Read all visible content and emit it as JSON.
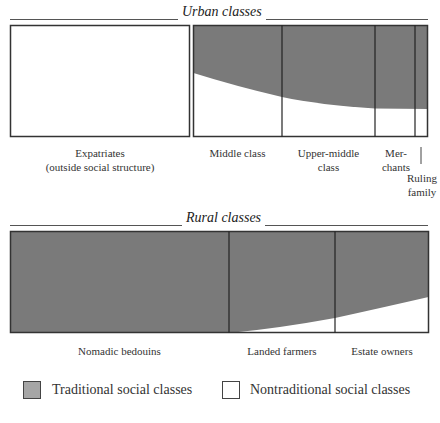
{
  "urban": {
    "title": "Urban classes",
    "labels": {
      "expatriates_line1": "Expatriates",
      "expatriates_line2": "(outside social structure)",
      "middle": "Middle class",
      "upper_middle_line1": "Upper-middle",
      "upper_middle_line2": "class",
      "merchants_line1": "Mer-",
      "merchants_line2": "chants",
      "ruling_line1": "Ruling",
      "ruling_line2": "family"
    }
  },
  "rural": {
    "title": "Rural classes",
    "labels": {
      "nomadic": "Nomadic bedouins",
      "landed": "Landed farmers",
      "estate": "Estate owners"
    }
  },
  "legend": {
    "traditional": "Traditional social classes",
    "nontraditional": "Nontraditional social classes"
  },
  "colors": {
    "traditional": "#7a7a7a",
    "nontraditional": "#ffffff",
    "border": "#333333"
  }
}
